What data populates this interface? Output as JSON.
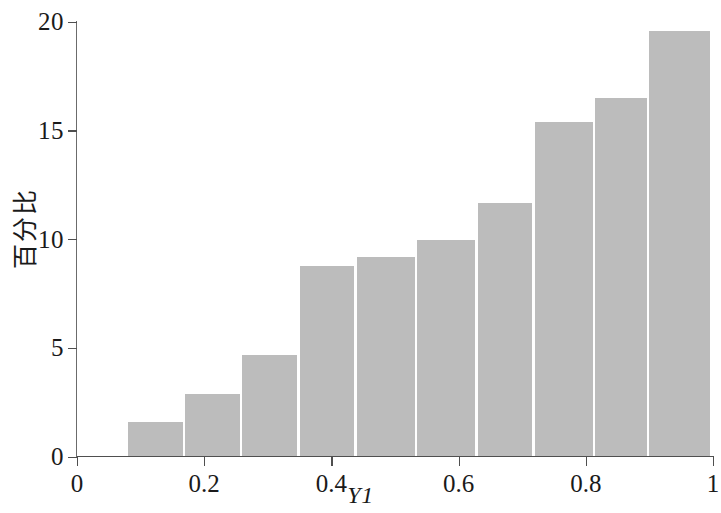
{
  "chart_data": {
    "type": "bar",
    "title": "",
    "xlabel": "Y1",
    "ylabel": "百分比",
    "xlim": [
      0,
      1
    ],
    "ylim": [
      0,
      20
    ],
    "grid": false,
    "legend": null,
    "bar_color": "#bcbcbc",
    "bar_edge_color": "#ffffff",
    "axis_color": "#4f4f4f",
    "x_ticks": [
      "0",
      "0.2",
      "0.4",
      "0.6",
      "0.8",
      "1"
    ],
    "x_tick_values": [
      0,
      0.2,
      0.4,
      0.6,
      0.8,
      1
    ],
    "y_ticks": [
      "0",
      "5",
      "10",
      "15",
      "20"
    ],
    "y_tick_values": [
      0,
      5,
      10,
      15,
      20
    ],
    "bin_edges": [
      0.08,
      0.17,
      0.26,
      0.35,
      0.44,
      0.535,
      0.63,
      0.72,
      0.815,
      0.9,
      1.0
    ],
    "categories": [
      "0.08-0.17",
      "0.17-0.26",
      "0.26-0.35",
      "0.35-0.44",
      "0.44-0.535",
      "0.535-0.63",
      "0.63-0.72",
      "0.72-0.815",
      "0.815-0.9",
      "0.9-1.0"
    ],
    "values": [
      1.6,
      2.9,
      4.7,
      8.8,
      9.2,
      10.0,
      11.7,
      15.4,
      16.5,
      19.6
    ]
  }
}
